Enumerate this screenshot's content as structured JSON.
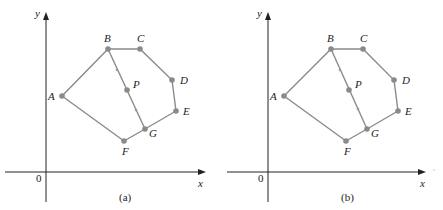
{
  "panels": [
    {
      "caption": "(a)",
      "offset_x": 0,
      "axes": {
        "x_label": "x",
        "y_label": "y",
        "origin_label": "0"
      },
      "points": {
        "A": {
          "label": "A",
          "x": 62,
          "y": 96
        },
        "B": {
          "label": "B",
          "x": 108,
          "y": 49
        },
        "C": {
          "label": "C",
          "x": 140,
          "y": 49
        },
        "D": {
          "label": "D",
          "x": 172,
          "y": 80
        },
        "E": {
          "label": "E",
          "x": 176,
          "y": 111
        },
        "G": {
          "label": "G",
          "x": 145,
          "y": 129
        },
        "F": {
          "label": "F",
          "x": 124,
          "y": 141
        },
        "P": {
          "label": "P",
          "x": 127,
          "y": 90
        }
      }
    },
    {
      "caption": "(b)",
      "offset_x": 222,
      "axes": {
        "x_label": "x",
        "y_label": "y",
        "origin_label": "0"
      },
      "points": {
        "A": {
          "label": "A",
          "x": 62,
          "y": 96
        },
        "B": {
          "label": "B",
          "x": 108,
          "y": 49
        },
        "C": {
          "label": "C",
          "x": 140,
          "y": 49
        },
        "D": {
          "label": "D",
          "x": 172,
          "y": 80
        },
        "E": {
          "label": "E",
          "x": 176,
          "y": 111
        },
        "G": {
          "label": "G",
          "x": 145,
          "y": 129
        },
        "F": {
          "label": "F",
          "x": 124,
          "y": 141
        },
        "P": {
          "label": "P",
          "x": 127,
          "y": 90
        }
      }
    }
  ],
  "polygon_order": [
    "A",
    "B",
    "C",
    "D",
    "E",
    "G",
    "F"
  ],
  "segment_BG": {
    "from": "B",
    "to": "G",
    "midpoint": "P"
  }
}
